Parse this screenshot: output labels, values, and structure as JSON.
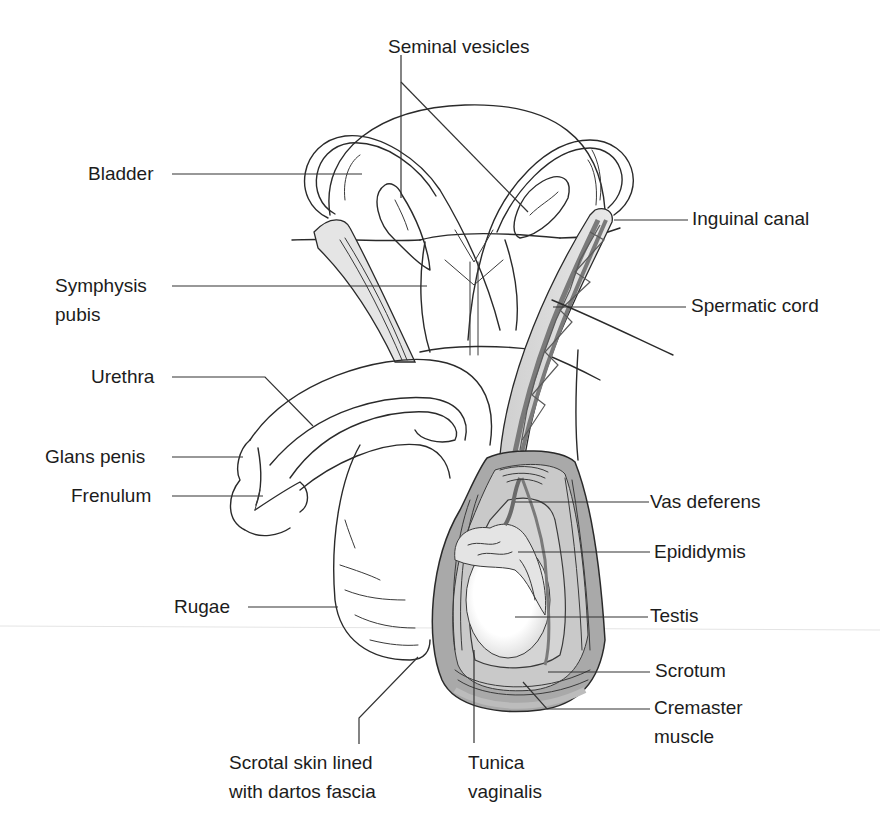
{
  "figure": {
    "colors": {
      "background": "#ffffff",
      "outline": "#2a2a2a",
      "muscle_layer": "#8c8c8c",
      "muscle_light": "#c8c8c8",
      "tissue_light": "#e3e3e3",
      "label_text": "#1c1c1c"
    }
  },
  "labels": {
    "seminal_vesicles": "Seminal vesicles",
    "bladder": "Bladder",
    "inguinal_canal": "Inguinal canal",
    "symphysis_pubis_1": "Symphysis",
    "symphysis_pubis_2": "pubis",
    "spermatic_cord": "Spermatic cord",
    "urethra": "Urethra",
    "glans_penis": "Glans penis",
    "frenulum": "Frenulum",
    "vas_deferens": "Vas deferens",
    "epididymis": "Epididymis",
    "rugae": "Rugae",
    "testis": "Testis",
    "scrotum": "Scrotum",
    "cremaster_1": "Cremaster",
    "cremaster_2": "muscle",
    "scrotal_skin_1": "Scrotal skin lined",
    "scrotal_skin_2": "with dartos fascia",
    "tunica_1": "Tunica",
    "tunica_2": "vaginalis"
  }
}
